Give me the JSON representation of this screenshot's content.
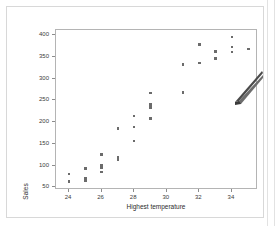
{
  "figure": {
    "background_color": "#ffffff",
    "frame_color": "#b4b4b4",
    "point_color": "#6b6b6b"
  },
  "cursor": {
    "name": "pencil-cursor",
    "body_color": "#4a4a4a",
    "tip_color": "#6d6d6d"
  },
  "chart_data": {
    "type": "scatter",
    "title": "",
    "xlabel": "Highest temperature",
    "ylabel": "Sales",
    "xlim": [
      23.2,
      35.6
    ],
    "ylim": [
      44,
      412
    ],
    "xticks": [
      24,
      26,
      28,
      30,
      32,
      34
    ],
    "yticks": [
      50,
      100,
      150,
      200,
      250,
      300,
      350,
      400
    ],
    "xticklabels": [
      "24",
      "26",
      "28",
      "30",
      "32",
      "34"
    ],
    "yticklabels": [
      "50",
      "100",
      "150",
      "200",
      "250",
      "300",
      "350",
      "400"
    ],
    "grid": false,
    "legend": null,
    "marker": "square",
    "points": [
      {
        "x": 24.0,
        "y": 81
      },
      {
        "x": 24.0,
        "y": 63
      },
      {
        "x": 25.0,
        "y": 93
      },
      {
        "x": 25.0,
        "y": 70
      },
      {
        "x": 25.0,
        "y": 65
      },
      {
        "x": 26.0,
        "y": 125
      },
      {
        "x": 26.0,
        "y": 101
      },
      {
        "x": 26.0,
        "y": 95
      },
      {
        "x": 26.0,
        "y": 85
      },
      {
        "x": 27.0,
        "y": 185
      },
      {
        "x": 27.0,
        "y": 119
      },
      {
        "x": 27.0,
        "y": 114
      },
      {
        "x": 28.0,
        "y": 214
      },
      {
        "x": 28.0,
        "y": 189
      },
      {
        "x": 28.0,
        "y": 157
      },
      {
        "x": 29.0,
        "y": 267
      },
      {
        "x": 29.0,
        "y": 241
      },
      {
        "x": 29.0,
        "y": 234
      },
      {
        "x": 29.0,
        "y": 209
      },
      {
        "x": 31.0,
        "y": 333
      },
      {
        "x": 31.0,
        "y": 268
      },
      {
        "x": 32.0,
        "y": 379
      },
      {
        "x": 32.0,
        "y": 336
      },
      {
        "x": 33.0,
        "y": 362
      },
      {
        "x": 33.0,
        "y": 347
      },
      {
        "x": 34.0,
        "y": 396
      },
      {
        "x": 34.0,
        "y": 373
      },
      {
        "x": 34.0,
        "y": 361
      },
      {
        "x": 35.0,
        "y": 368
      }
    ]
  }
}
